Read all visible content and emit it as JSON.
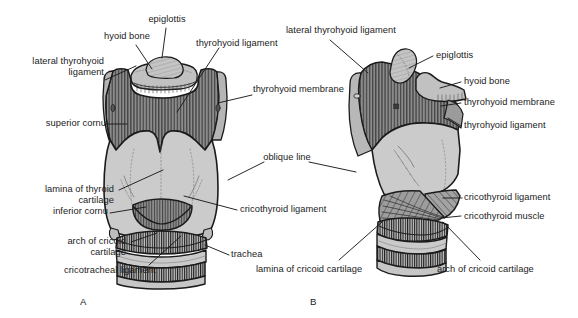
{
  "figure": {
    "background_color": "#ffffff",
    "ink_color": "#1b1b1b",
    "palette": {
      "cartilage_fill": "#c9c9c9",
      "membrane_fill": "#8c8c8c",
      "muscle_fill": "#9a9a9a",
      "bone_fill": "#bcbcbc",
      "outline": "#1b1b1b",
      "label_text": "#1b1b1b"
    },
    "panels": [
      {
        "id": "A",
        "letter": "A",
        "view": "anterior view of the larynx"
      },
      {
        "id": "B",
        "letter": "B",
        "view": "lateral view of the larynx"
      }
    ]
  },
  "panel_a": {
    "letter": "A",
    "labels": [
      {
        "name": "epiglottis",
        "text": "epiglottis"
      },
      {
        "name": "hyoid-bone",
        "text": "hyoid bone"
      },
      {
        "name": "thyrohyoid-ligament",
        "text": "thyrohyoid ligament"
      },
      {
        "name": "lateral-thyrohyoid-ligament-line1",
        "text": "lateral thyrohyoid"
      },
      {
        "name": "lateral-thyrohyoid-ligament-line2",
        "text": "ligament"
      },
      {
        "name": "thyrohyoid-membrane",
        "text": "thyrohyoid membrane"
      },
      {
        "name": "superior-cornu",
        "text": "superior cornu"
      },
      {
        "name": "oblique-line",
        "text": "oblique line"
      },
      {
        "name": "lamina-of-thyroid-cartilage-line1",
        "text": "lamina of thyroid"
      },
      {
        "name": "lamina-of-thyroid-cartilage-line2",
        "text": "cartilage"
      },
      {
        "name": "inferior-cornu",
        "text": "inferior cornu"
      },
      {
        "name": "cricothyroid-ligament",
        "text": "cricothyroid ligament"
      },
      {
        "name": "arch-of-cricoid-cartilage-line1",
        "text": "arch of cricoid"
      },
      {
        "name": "arch-of-cricoid-cartilage-line2",
        "text": "cartilage"
      },
      {
        "name": "cricotracheal-ligament",
        "text": "cricotracheal ligament"
      },
      {
        "name": "trachea",
        "text": "trachea"
      }
    ]
  },
  "panel_b": {
    "letter": "B",
    "labels": [
      {
        "name": "lateral-thyrohyoid-ligament",
        "text": "lateral thyrohyoid ligament"
      },
      {
        "name": "epiglottis",
        "text": "epiglottis"
      },
      {
        "name": "hyoid-bone",
        "text": "hyoid bone"
      },
      {
        "name": "thyrohyoid-membrane",
        "text": "thyrohyoid membrane"
      },
      {
        "name": "thyrohyoid-ligament",
        "text": "thyrohyoid ligament"
      },
      {
        "name": "cricothyroid-ligament",
        "text": "cricothyroid ligament"
      },
      {
        "name": "cricothyroid-muscle",
        "text": "cricothyroid muscle"
      },
      {
        "name": "lamina-of-cricoid-cartilage",
        "text": "lamina of cricoid cartilage"
      },
      {
        "name": "arch-of-cricoid-cartilage",
        "text": "arch of cricoid cartilage"
      }
    ]
  }
}
